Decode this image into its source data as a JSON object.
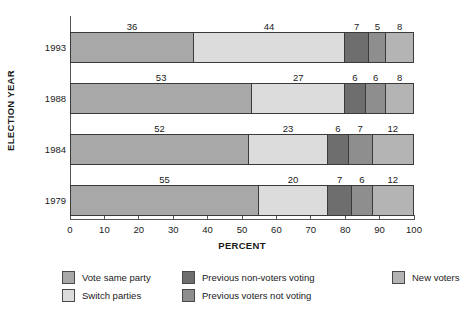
{
  "chart_data": {
    "type": "bar",
    "orientation": "horizontal",
    "stacked": true,
    "title": "",
    "xlabel": "PERCENT",
    "ylabel": "ELECTION YEAR",
    "xlim": [
      0,
      100
    ],
    "grid": false,
    "legend_position": "bottom",
    "xticks": [
      "0",
      "10",
      "20",
      "30",
      "40",
      "50",
      "60",
      "70",
      "80",
      "90",
      "100"
    ],
    "categories": [
      "1993",
      "1988",
      "1984",
      "1979"
    ],
    "series": [
      {
        "name": "Vote same party",
        "color": "#a8a8a8",
        "values": [
          36,
          53,
          52,
          55
        ]
      },
      {
        "name": "Switch parties",
        "color": "#dcdcdc",
        "values": [
          44,
          27,
          23,
          20
        ]
      },
      {
        "name": "Previous non-voters voting",
        "color": "#6e6e6e",
        "values": [
          7,
          6,
          6,
          7
        ]
      },
      {
        "name": "Previous voters not voting",
        "color": "#8e8e8e",
        "values": [
          5,
          6,
          7,
          6
        ]
      },
      {
        "name": "New voters",
        "color": "#b4b4b4",
        "values": [
          8,
          8,
          12,
          12
        ]
      }
    ],
    "rows": [
      {
        "year": "1993",
        "segments": [
          {
            "label": "36",
            "value": 36,
            "series": "Vote same party",
            "color": "#a8a8a8"
          },
          {
            "label": "44",
            "value": 44,
            "series": "Switch parties",
            "color": "#dcdcdc"
          },
          {
            "label": "7",
            "value": 7,
            "series": "Previous non-voters voting",
            "color": "#6e6e6e"
          },
          {
            "label": "5",
            "value": 5,
            "series": "Previous voters not voting",
            "color": "#8e8e8e"
          },
          {
            "label": "8",
            "value": 8,
            "series": "New voters",
            "color": "#b4b4b4"
          }
        ]
      },
      {
        "year": "1988",
        "segments": [
          {
            "label": "53",
            "value": 53,
            "series": "Vote same party",
            "color": "#a8a8a8"
          },
          {
            "label": "27",
            "value": 27,
            "series": "Switch parties",
            "color": "#dcdcdc"
          },
          {
            "label": "6",
            "value": 6,
            "series": "Previous non-voters voting",
            "color": "#6e6e6e"
          },
          {
            "label": "6",
            "value": 6,
            "series": "Previous voters not voting",
            "color": "#8e8e8e"
          },
          {
            "label": "8",
            "value": 8,
            "series": "New voters",
            "color": "#b4b4b4"
          }
        ]
      },
      {
        "year": "1984",
        "segments": [
          {
            "label": "52",
            "value": 52,
            "series": "Vote same party",
            "color": "#a8a8a8"
          },
          {
            "label": "23",
            "value": 23,
            "series": "Switch parties",
            "color": "#dcdcdc"
          },
          {
            "label": "6",
            "value": 6,
            "series": "Previous non-voters voting",
            "color": "#6e6e6e"
          },
          {
            "label": "7",
            "value": 7,
            "series": "Previous voters not voting",
            "color": "#8e8e8e"
          },
          {
            "label": "12",
            "value": 12,
            "series": "New voters",
            "color": "#b4b4b4"
          }
        ]
      },
      {
        "year": "1979",
        "segments": [
          {
            "label": "55",
            "value": 55,
            "series": "Vote same party",
            "color": "#a8a8a8"
          },
          {
            "label": "20",
            "value": 20,
            "series": "Switch parties",
            "color": "#dcdcdc"
          },
          {
            "label": "7",
            "value": 7,
            "series": "Previous non-voters voting",
            "color": "#6e6e6e"
          },
          {
            "label": "6",
            "value": 6,
            "series": "Previous voters not voting",
            "color": "#8e8e8e"
          },
          {
            "label": "12",
            "value": 12,
            "series": "New voters",
            "color": "#b4b4b4"
          }
        ]
      }
    ],
    "legend": [
      {
        "label": "Vote same party",
        "color": "#a8a8a8"
      },
      {
        "label": "Previous non-voters voting",
        "color": "#6e6e6e"
      },
      {
        "label": "New voters",
        "color": "#b4b4b4"
      },
      {
        "label": "Switch parties",
        "color": "#dcdcdc"
      },
      {
        "label": "Previous voters not voting",
        "color": "#8e8e8e"
      }
    ]
  }
}
